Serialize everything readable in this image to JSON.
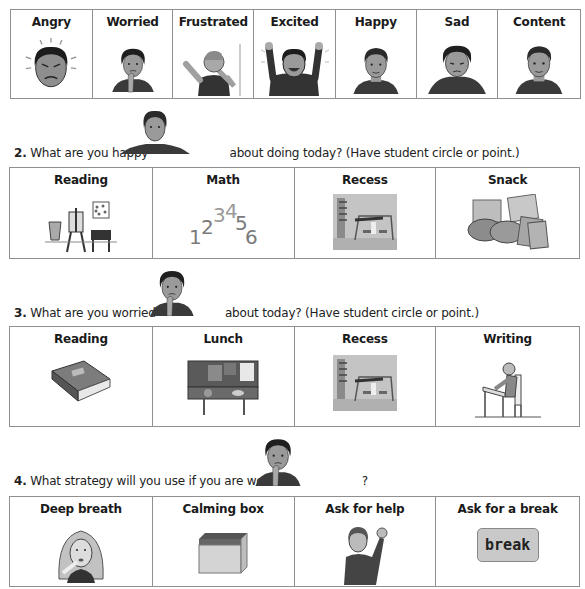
{
  "feelings_row": {
    "items": [
      {
        "label": "Angry",
        "icon": "angry-face-icon"
      },
      {
        "label": "Worried",
        "icon": "worried-face-icon"
      },
      {
        "label": "Frustrated",
        "icon": "frustrated-person-icon"
      },
      {
        "label": "Excited",
        "icon": "excited-person-icon"
      },
      {
        "label": "Happy",
        "icon": "happy-face-icon"
      },
      {
        "label": "Sad",
        "icon": "sad-face-icon"
      },
      {
        "label": "Content",
        "icon": "content-face-icon"
      }
    ]
  },
  "question2": {
    "number": "2.",
    "text_before": "What are you happy",
    "text_after": "about doing today? (Have student circle or point.)",
    "inline_icon": "happy-face-icon",
    "options": [
      {
        "label": "Reading",
        "icon": "art-easel-icon"
      },
      {
        "label": "Math",
        "icon": "numbers-icon",
        "numbers": [
          "1",
          "2",
          "3",
          "4",
          "5",
          "6"
        ]
      },
      {
        "label": "Recess",
        "icon": "playground-icon"
      },
      {
        "label": "Snack",
        "icon": "crackers-cookies-icon"
      }
    ]
  },
  "question3": {
    "number": "3.",
    "text_before": "What are you worried",
    "text_after": "about today? (Have student circle or point.)",
    "inline_icon": "worried-face-icon",
    "options": [
      {
        "label": "Reading",
        "icon": "book-icon"
      },
      {
        "label": "Lunch",
        "icon": "lunch-counter-icon"
      },
      {
        "label": "Recess",
        "icon": "playground-icon"
      },
      {
        "label": "Writing",
        "icon": "student-writing-icon"
      }
    ]
  },
  "question4": {
    "number": "4.",
    "text_before": "What strategy will you use if you are worried",
    "text_after": "?",
    "inline_icon": "worried-face-icon",
    "options": [
      {
        "label": "Deep breath",
        "icon": "deep-breath-icon"
      },
      {
        "label": "Calming box",
        "icon": "box-icon"
      },
      {
        "label": "Ask for help",
        "icon": "raised-hand-icon"
      },
      {
        "label": "Ask for a break",
        "icon": "break-card-icon",
        "card_text": "break"
      }
    ]
  },
  "colors": {
    "border": "#8f8f8f",
    "skin": "#9a9a9a",
    "hair": "#2a2a2a",
    "shirt": "#3a3a3a",
    "break_card": "#c9c9c9"
  }
}
